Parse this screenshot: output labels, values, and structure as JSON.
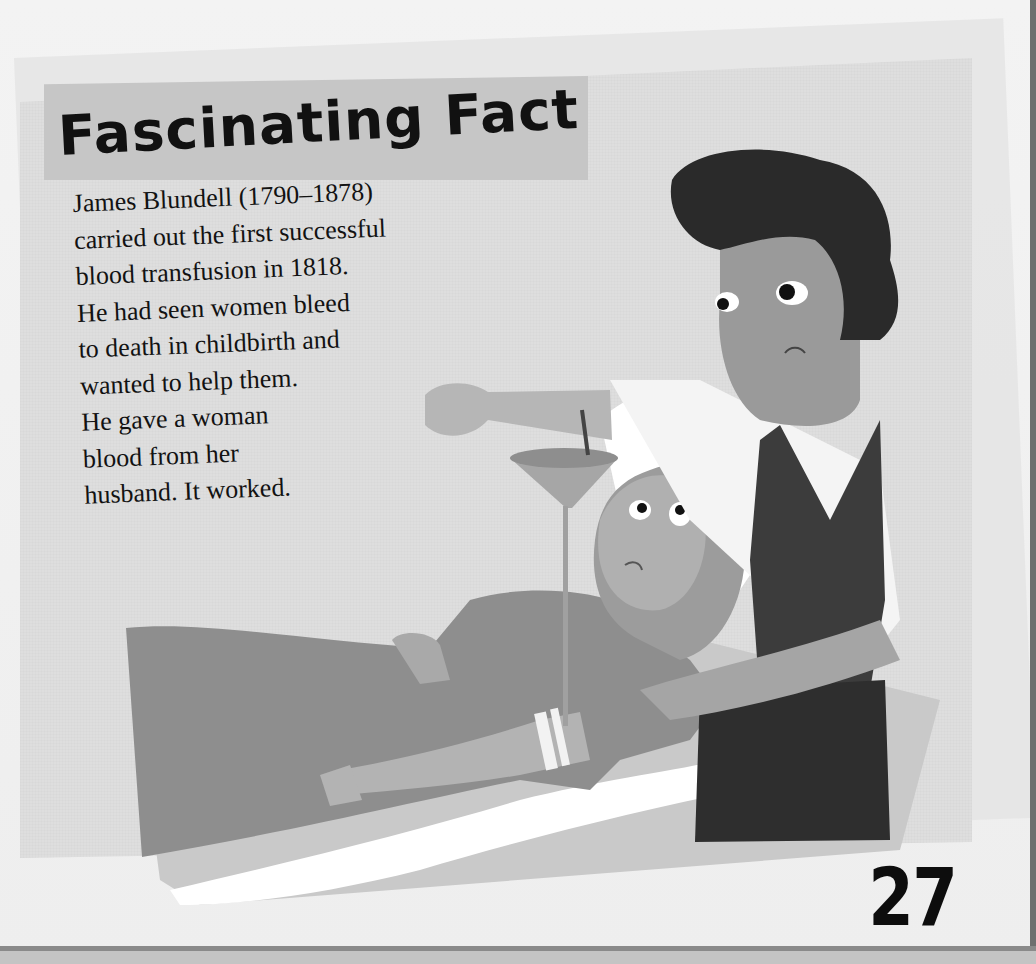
{
  "page": {
    "section_title": "Fascinating Fact",
    "fact_lines": [
      "James Blundell (1790–1878)",
      "carried out the first successful",
      "blood transfusion in 1818.",
      "He had seen women bleed",
      "to death in childbirth and",
      "wanted to help them.",
      "He gave a woman",
      "blood from her",
      "husband. It worked."
    ],
    "page_number": "27"
  },
  "illustration": {
    "description": "Doctor with curly dark hair, white shirt and dark waistcoat, holding arm over a funnel dripping blood into a tube leading to a worried woman lying in bed wearing a frilly bonnet",
    "figures": [
      "doctor",
      "patient-woman",
      "transfusion-funnel",
      "bed"
    ]
  },
  "colors": {
    "page_bg": "#f1f1f1",
    "panel_bg": "#dedede",
    "title_band": "#c6c6c6",
    "text": "#121212",
    "edge_dark": "#6f6f6f"
  }
}
